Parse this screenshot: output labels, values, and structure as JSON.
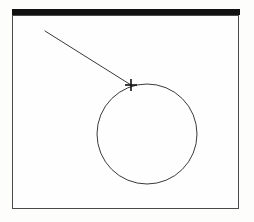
{
  "document": {
    "title": "Drawing Canvas",
    "background_color": "#fdfdfc",
    "width": 254,
    "height": 222
  },
  "titlebar": {
    "name": "title-bar-band",
    "label": "",
    "color": "#111111",
    "x": 12,
    "y": 9,
    "width": 228,
    "height": 6
  },
  "canvas": {
    "name": "drawing-canvas",
    "border_color": "#4a4a4a",
    "fill_color": "#fefefe",
    "x": 12,
    "y": 15,
    "width": 227,
    "height": 194
  },
  "shapes": {
    "circle": {
      "name": "circle-shape",
      "type": "circle",
      "center_x": 147,
      "center_y": 134,
      "radius": 50,
      "stroke_color": "#3a3a3a",
      "stroke_width": 1,
      "fill": "none",
      "label": "Circle"
    },
    "leader_line": {
      "name": "leader-line",
      "type": "line",
      "x1": 45,
      "y1": 31,
      "x2": 131,
      "y2": 85,
      "stroke_color": "#3a3a3a",
      "stroke_width": 1,
      "label": "Leader line"
    },
    "cursor": {
      "name": "crosshair-cursor",
      "type": "crosshair",
      "x": 131,
      "y": 85,
      "arm_length": 6,
      "stroke_color": "#111111",
      "stroke_width": 1.6,
      "label": "Crosshair pointer"
    }
  }
}
